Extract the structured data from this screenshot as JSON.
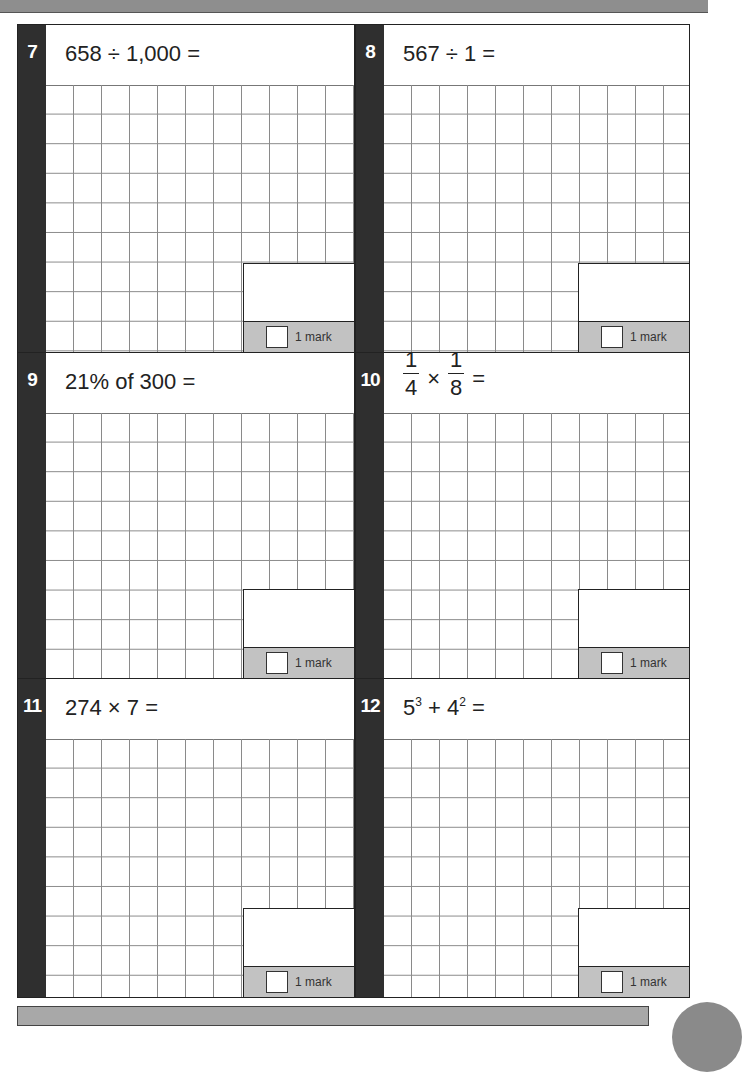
{
  "page": {
    "top_bar_color": "#8e8e8e",
    "strip_color": "#2f2f2f",
    "mark_band_color": "#c2c2c2"
  },
  "questions": [
    {
      "number": "7",
      "text": "658 ÷ 1,000 =",
      "mark_label": "1 mark"
    },
    {
      "number": "8",
      "text": "567 ÷ 1 =",
      "mark_label": "1 mark"
    },
    {
      "number": "9",
      "text": "21% of 300 =",
      "mark_label": "1 mark"
    },
    {
      "number": "10",
      "fraction_a": {
        "numerator": "1",
        "denominator": "4"
      },
      "operator": "×",
      "fraction_b": {
        "numerator": "1",
        "denominator": "8"
      },
      "equals": "=",
      "mark_label": "1 mark"
    },
    {
      "number": "11",
      "text": "274 × 7 =",
      "mark_label": "1 mark"
    },
    {
      "number": "12",
      "base_a": "5",
      "exp_a": "3",
      "operator": "+",
      "base_b": "4",
      "exp_b": "2",
      "equals": "=",
      "mark_label": "1 mark"
    }
  ]
}
